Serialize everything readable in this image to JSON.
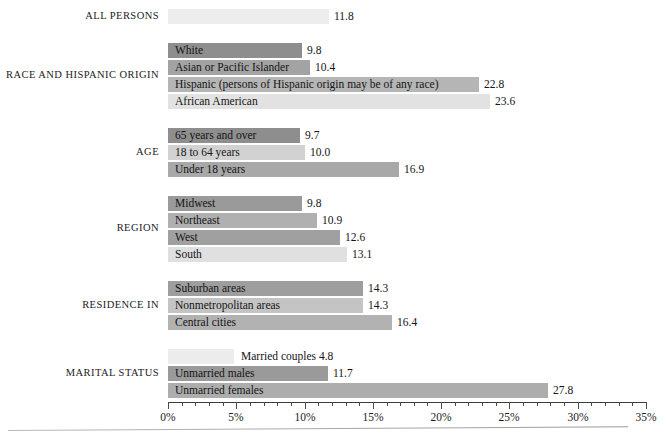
{
  "chart_data": {
    "type": "bar",
    "orientation": "horizontal",
    "title": "",
    "xlabel": "",
    "ylabel": "",
    "xlim": [
      0,
      35
    ],
    "xunit": "%",
    "grid": false,
    "legend": "none",
    "xticks": [
      "0%",
      "5%",
      "10%",
      "15%",
      "20%",
      "25%",
      "30%",
      "35%"
    ],
    "xtick_values": [
      0,
      5,
      10,
      15,
      20,
      25,
      30,
      35
    ],
    "minor_tick_step": 1,
    "groups": [
      {
        "name": "ALL PERSONS",
        "bars": [
          {
            "label": "",
            "value": 11.8,
            "display": "11.8",
            "color": "#ededed",
            "label_inside": false
          }
        ]
      },
      {
        "name": "RACE AND HISPANIC ORIGIN",
        "bars": [
          {
            "label": "White",
            "value": 9.8,
            "display": "9.8",
            "color": "#8e8e8e",
            "label_inside": true
          },
          {
            "label": "Asian or Pacific Islander",
            "value": 10.4,
            "display": "10.4",
            "color": "#a3a3a3",
            "label_inside": true
          },
          {
            "label": "Hispanic (persons of Hispanic origin may be of any race)",
            "value": 22.8,
            "display": "22.8",
            "color": "#b5b5b5",
            "label_inside": true
          },
          {
            "label": "African American",
            "value": 23.6,
            "display": "23.6",
            "color": "#e2e2e2",
            "label_inside": true
          }
        ]
      },
      {
        "name": "AGE",
        "bars": [
          {
            "label": "65 years and over",
            "value": 9.7,
            "display": "9.7",
            "color": "#8e8e8e",
            "label_inside": true
          },
          {
            "label": "18 to 64 years",
            "value": 10.0,
            "display": "10.0",
            "color": "#d2d2d2",
            "label_inside": true
          },
          {
            "label": "Under 18 years",
            "value": 16.9,
            "display": "16.9",
            "color": "#a8a8a8",
            "label_inside": true
          }
        ]
      },
      {
        "name": "REGION",
        "bars": [
          {
            "label": "Midwest",
            "value": 9.8,
            "display": "9.8",
            "color": "#9a9a9a",
            "label_inside": true
          },
          {
            "label": "Northeast",
            "value": 10.9,
            "display": "10.9",
            "color": "#b0b0b0",
            "label_inside": true
          },
          {
            "label": "West",
            "value": 12.6,
            "display": "12.6",
            "color": "#a0a0a0",
            "label_inside": true
          },
          {
            "label": "South",
            "value": 13.1,
            "display": "13.1",
            "color": "#e0e0e0",
            "label_inside": true
          }
        ]
      },
      {
        "name": "RESIDENCE IN",
        "bars": [
          {
            "label": "Suburban areas",
            "value": 14.3,
            "display": "14.3",
            "color": "#9e9e9e",
            "label_inside": true
          },
          {
            "label": "Nonmetropolitan areas",
            "value": 14.3,
            "display": "14.3",
            "color": "#c4c4c4",
            "label_inside": true
          },
          {
            "label": "Central cities",
            "value": 16.4,
            "display": "16.4",
            "color": "#b2b2b2",
            "label_inside": true
          }
        ]
      },
      {
        "name": "MARITAL STATUS",
        "bars": [
          {
            "label": "Married couples",
            "value": 4.8,
            "display": "4.8",
            "color": "#ececec",
            "label_inside": false,
            "label_value_joined": "Married couples 4.8"
          },
          {
            "label": "Unmarried males",
            "value": 11.7,
            "display": "11.7",
            "color": "#9a9a9a",
            "label_inside": true
          },
          {
            "label": "Unmarried females",
            "value": 27.8,
            "display": "27.8",
            "color": "#adadad",
            "label_inside": true
          }
        ]
      }
    ]
  },
  "colors": {
    "axis": "#3c3c3c",
    "text": "#1b1b1b",
    "footer_rule": "#a8a8a8"
  }
}
